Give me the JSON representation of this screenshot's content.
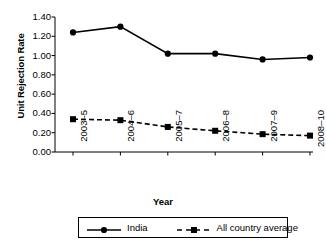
{
  "chart_data": {
    "type": "line",
    "title": "",
    "xlabel": "Year",
    "ylabel": "Unit Rejection Rate",
    "categories": [
      "2003–5",
      "2004–6",
      "2005–7",
      "2006–8",
      "2007–9",
      "2008–10"
    ],
    "series": [
      {
        "name": "India",
        "values": [
          1.24,
          1.3,
          1.02,
          1.02,
          0.96,
          0.98
        ],
        "line_style": "solid",
        "marker": "circle",
        "color": "#000000"
      },
      {
        "name": "All country average",
        "values": [
          0.34,
          0.33,
          0.26,
          0.22,
          0.185,
          0.17
        ],
        "line_style": "dashed",
        "marker": "square",
        "color": "#000000"
      }
    ],
    "ylim": [
      0.0,
      1.4
    ],
    "yticks": [
      0.0,
      0.2,
      0.4,
      0.6,
      0.8,
      1.0,
      1.2,
      1.4
    ],
    "ytick_labels": [
      "0.00",
      "0.20",
      "0.40",
      "0.60",
      "0.80",
      "1.00",
      "1.20",
      "1.40"
    ],
    "grid": false,
    "legend_position": "bottom",
    "background": "#ffffff",
    "axis_color": "#000000"
  },
  "legend": {
    "entries": [
      {
        "label": "India"
      },
      {
        "label": "All country average"
      }
    ]
  },
  "axes": {
    "y_title": "Unit Rejection Rate",
    "x_title": "Year"
  }
}
